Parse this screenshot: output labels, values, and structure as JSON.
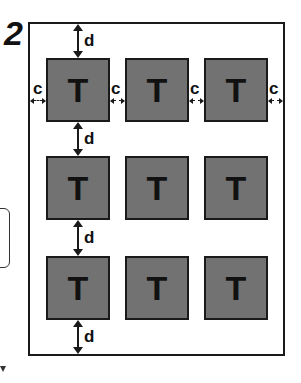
{
  "figure": {
    "number": "2"
  },
  "tiles": {
    "label": "T",
    "rows": 3,
    "cols": 3,
    "items": [
      {
        "row": 1,
        "col": 1,
        "label": "T"
      },
      {
        "row": 1,
        "col": 2,
        "label": "T"
      },
      {
        "row": 1,
        "col": 3,
        "label": "T"
      },
      {
        "row": 2,
        "col": 1,
        "label": "T"
      },
      {
        "row": 2,
        "col": 2,
        "label": "T"
      },
      {
        "row": 2,
        "col": 3,
        "label": "T"
      },
      {
        "row": 3,
        "col": 1,
        "label": "T"
      },
      {
        "row": 3,
        "col": 2,
        "label": "T"
      },
      {
        "row": 3,
        "col": 3,
        "label": "T"
      }
    ]
  },
  "dimensions": {
    "vertical_gap_label": "d",
    "horizontal_gap_label": "c",
    "vertical": [
      {
        "position": "top-margin",
        "label": "d"
      },
      {
        "position": "row1-row2",
        "label": "d"
      },
      {
        "position": "row2-row3",
        "label": "d"
      },
      {
        "position": "bottom-margin",
        "label": "d"
      }
    ],
    "horizontal": [
      {
        "position": "left-margin",
        "label": "c"
      },
      {
        "position": "col1-col2",
        "label": "c"
      },
      {
        "position": "col2-col3",
        "label": "c"
      },
      {
        "position": "right-margin",
        "label": "c"
      }
    ]
  },
  "colors": {
    "line": "#1a1a1a",
    "tile_fill": "#c9c9c9",
    "background": "#ffffff"
  }
}
